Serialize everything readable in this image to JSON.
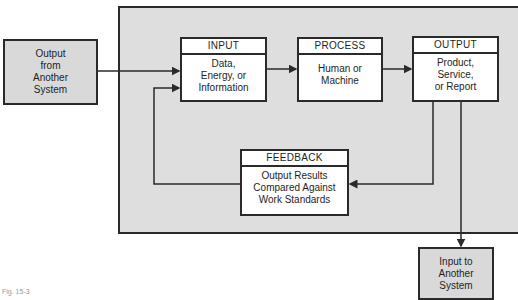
{
  "diagram": {
    "external_in": "Output\nfrom\nAnother\nSystem",
    "external_out": "Input to\nAnother\nSystem",
    "input": {
      "title": "INPUT",
      "body": "Data,\nEnergy, or\nInformation"
    },
    "process": {
      "title": "PROCESS",
      "body": "Human or\nMachine"
    },
    "output": {
      "title": "OUTPUT",
      "body": "Product,\nService,\nor Report"
    },
    "feedback": {
      "title": "FEEDBACK",
      "body": "Output Results\nCompared Against\nWork Standards"
    },
    "caption": "Fig. 15-3"
  }
}
